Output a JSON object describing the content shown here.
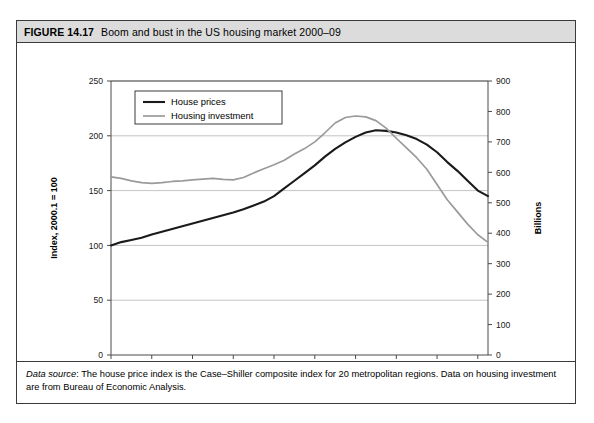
{
  "figure": {
    "number": "FIGURE 14.17",
    "title": "Boom and bust in the US housing market 2000–09",
    "footnote_label": "Data source",
    "footnote_text": ": The house price index is the Case–Shiller composite index for 20 metropolitan regions. Data on housing investment are from Bureau of Economic Analysis."
  },
  "colors": {
    "house_prices": "#1a1a1a",
    "housing_investment": "#9a9a9a",
    "grid": "#c4c4c4",
    "axis": "#4a4a4a",
    "header_background": "#dcdcdc",
    "border": "#3a3a3a"
  },
  "chart_data": {
    "type": "line",
    "title": "Boom and bust in the US housing market 2000–09",
    "xlabel": "",
    "ylabel": "Index, 2000.1 = 100",
    "y2label": "Billions",
    "xlim": [
      2000,
      2009.25
    ],
    "ylim": [
      0,
      250
    ],
    "y2lim": [
      0,
      900
    ],
    "yticks": [
      0,
      50,
      100,
      150,
      200,
      250
    ],
    "y2ticks": [
      0,
      100,
      200,
      300,
      400,
      500,
      600,
      700,
      800,
      900
    ],
    "xticks": [
      2000,
      2001,
      2002,
      2003,
      2004,
      2005,
      2006,
      2007,
      2008,
      2009
    ],
    "xtick_labels": [
      "2000",
      "2001",
      "2002",
      "2003",
      "2004",
      "2005",
      "2006",
      "2007",
      "2008",
      "2009"
    ],
    "grid": true,
    "grid_axis": "y",
    "legend_position": "upper left",
    "series": [
      {
        "name": "House prices",
        "axis": "left",
        "color": "#1a1a1a",
        "width": 2.1,
        "x": [
          2000.0,
          2000.25,
          2000.5,
          2000.75,
          2001.0,
          2001.25,
          2001.5,
          2001.75,
          2002.0,
          2002.25,
          2002.5,
          2002.75,
          2003.0,
          2003.25,
          2003.5,
          2003.75,
          2004.0,
          2004.25,
          2004.5,
          2004.75,
          2005.0,
          2005.25,
          2005.5,
          2005.75,
          2006.0,
          2006.25,
          2006.5,
          2006.75,
          2007.0,
          2007.25,
          2007.5,
          2007.75,
          2008.0,
          2008.25,
          2008.5,
          2008.75,
          2009.0,
          2009.25
        ],
        "y": [
          100,
          103,
          105,
          107,
          110,
          112.5,
          115,
          117.5,
          120,
          122.5,
          125,
          127.5,
          130,
          133,
          136.5,
          140,
          145,
          152,
          159,
          166,
          173,
          181,
          188,
          194,
          199,
          203,
          205,
          204.5,
          203,
          200.5,
          197,
          192,
          185,
          176,
          168,
          159,
          150,
          145
        ]
      },
      {
        "name": "Housing investment",
        "axis": "right",
        "color": "#9a9a9a",
        "width": 1.7,
        "x": [
          2000.0,
          2000.25,
          2000.5,
          2000.75,
          2001.0,
          2001.25,
          2001.5,
          2001.75,
          2002.0,
          2002.25,
          2002.5,
          2002.75,
          2003.0,
          2003.25,
          2003.5,
          2003.75,
          2004.0,
          2004.25,
          2004.5,
          2004.75,
          2005.0,
          2005.25,
          2005.5,
          2005.75,
          2006.0,
          2006.25,
          2006.5,
          2006.75,
          2007.0,
          2007.25,
          2007.5,
          2007.75,
          2008.0,
          2008.25,
          2008.5,
          2008.75,
          2009.0,
          2009.25
        ],
        "y": [
          585,
          580,
          572,
          566,
          564,
          566,
          570,
          572,
          575,
          578,
          580,
          577,
          575,
          583,
          598,
          612,
          625,
          640,
          660,
          678,
          700,
          730,
          762,
          780,
          785,
          782,
          770,
          745,
          712,
          680,
          648,
          610,
          560,
          510,
          470,
          430,
          395,
          370
        ]
      }
    ]
  },
  "legend": {
    "items": [
      {
        "label": "House prices",
        "color": "#1a1a1a"
      },
      {
        "label": "Housing investment",
        "color": "#9a9a9a"
      }
    ]
  }
}
